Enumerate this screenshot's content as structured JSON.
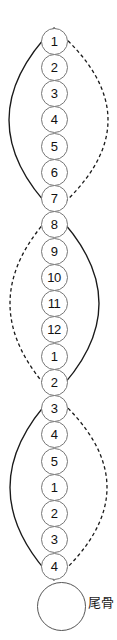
{
  "diagram": {
    "background_color": "#ffffff",
    "curve_color": "#1a1a1a",
    "circle_border_color": "#777777",
    "number_color": "#111111",
    "vertebrae": [
      "1",
      "2",
      "3",
      "4",
      "5",
      "6",
      "7",
      "8",
      "9",
      "10",
      "11",
      "12",
      "1",
      "2",
      "3",
      "4",
      "5",
      "1",
      "2",
      "3",
      "4"
    ],
    "coccyx_label": "尾骨",
    "lenses": [
      {
        "solid_side": "left",
        "dashed_side": "right",
        "first_circle": "1",
        "last_circle": "7"
      },
      {
        "solid_side": "right",
        "dashed_side": "left",
        "first_circle": "8",
        "last_circle": "2"
      },
      {
        "solid_side": "left",
        "dashed_side": "right",
        "first_circle": "3",
        "last_circle": "4"
      }
    ]
  }
}
